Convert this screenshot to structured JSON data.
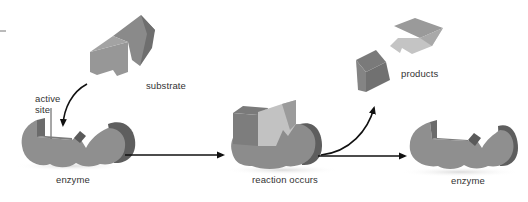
{
  "diagram": {
    "type": "enzyme-substrate-reaction",
    "labels": {
      "substrate": "substrate",
      "active_site": "active site",
      "active_site_line1": "active",
      "active_site_line2": "site",
      "enzyme_left": "enzyme",
      "reaction": "reaction occurs",
      "products": "products",
      "enzyme_right": "enzyme"
    },
    "stages": [
      {
        "name": "enzyme + substrate",
        "label": "enzyme"
      },
      {
        "name": "enzyme-substrate complex",
        "label": "reaction occurs"
      },
      {
        "name": "enzyme released",
        "label": "enzyme"
      }
    ],
    "colors": {
      "enzyme_face": "#8f8f8f",
      "enzyme_side": "#6e6e6e",
      "enzyme_dark": "#5c5c5c",
      "substrate_face": "#979797",
      "substrate_side": "#7a7a7a",
      "product_light": "#c4c4c4",
      "product_light_top": "#9a9a9a",
      "arrow": "#111111",
      "text": "#333333"
    }
  }
}
